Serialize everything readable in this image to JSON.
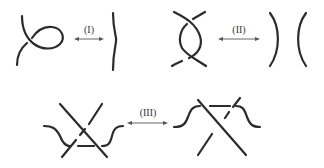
{
  "diagram": {
    "moves": [
      {
        "id": "move-1",
        "label": "(I)",
        "description": "Twist loop equivalent to straight strand"
      },
      {
        "id": "move-2",
        "label": "(II)",
        "description": "Two strands overlapping equivalent to two separate strands"
      },
      {
        "id": "move-3",
        "label": "(III)",
        "description": "Strand moved across a crossing"
      }
    ],
    "colors": {
      "strand": "#2b2b2b",
      "arrow": "#555555",
      "background": "#ffffff"
    }
  }
}
